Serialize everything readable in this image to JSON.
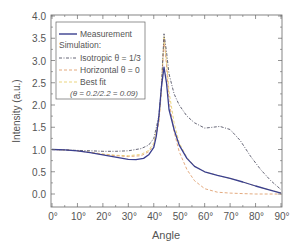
{
  "chart_data": {
    "type": "line",
    "title": "",
    "xlabel": "Angle",
    "ylabel": "Intensity (a.u.)",
    "xlim": [
      0,
      90
    ],
    "ylim": [
      -0.3,
      4.0
    ],
    "x_ticks": [
      "0°",
      "10°",
      "20°",
      "30°",
      "40°",
      "50°",
      "60°",
      "70°",
      "80°",
      "90°"
    ],
    "x_tick_values": [
      0,
      10,
      20,
      30,
      40,
      50,
      60,
      70,
      80,
      90
    ],
    "y_ticks": [
      "0.0",
      "0.5",
      "1.0",
      "1.5",
      "2.0",
      "2.5",
      "3.0",
      "3.5",
      "4.0"
    ],
    "y_tick_values": [
      0,
      0.5,
      1,
      1.5,
      2,
      2.5,
      3,
      3.5,
      4
    ],
    "grid": false,
    "legend_position": "upper left",
    "legend": {
      "entries": [
        {
          "label": "Measurement",
          "style": "solid",
          "color": "#3a3f8f"
        },
        {
          "label": "Simulation:",
          "style": "none",
          "color": ""
        },
        {
          "label": "Isotropic θ = 1/3",
          "style": "dashdot",
          "color": "#555566"
        },
        {
          "label": "Horizontal θ = 0",
          "style": "dashed",
          "color": "#e0a070"
        },
        {
          "label": "Best fit",
          "style": "dashed",
          "color": "#e8d070"
        },
        {
          "label": "(θ = 0.2/2.2 = 0.09)",
          "style": "none",
          "color": ""
        }
      ]
    },
    "series": [
      {
        "name": "Measurement",
        "color": "#3a3f8f",
        "style": "solid",
        "x": [
          0,
          5,
          10,
          15,
          20,
          25,
          30,
          33,
          36,
          38,
          40,
          41,
          42,
          43,
          44,
          45,
          46,
          48,
          50,
          53,
          56,
          60,
          65,
          70,
          75,
          80,
          85,
          90
        ],
        "y": [
          1.0,
          0.99,
          0.97,
          0.93,
          0.88,
          0.83,
          0.78,
          0.77,
          0.8,
          0.88,
          1.05,
          1.3,
          1.75,
          2.4,
          2.85,
          2.5,
          1.9,
          1.45,
          1.1,
          0.8,
          0.62,
          0.5,
          0.42,
          0.35,
          0.27,
          0.18,
          0.1,
          0.02
        ]
      },
      {
        "name": "Isotropic θ = 1/3",
        "color": "#555566",
        "style": "dashdot",
        "x": [
          0,
          5,
          10,
          15,
          20,
          25,
          30,
          35,
          38,
          40,
          42,
          43,
          44,
          45,
          46,
          48,
          50,
          53,
          56,
          60,
          63,
          66,
          70,
          74,
          78,
          82,
          86,
          90
        ],
        "y": [
          1.0,
          0.99,
          0.98,
          0.97,
          0.96,
          0.96,
          0.97,
          1.02,
          1.1,
          1.25,
          1.75,
          2.4,
          3.6,
          3.2,
          2.7,
          2.25,
          2.0,
          1.75,
          1.6,
          1.48,
          1.5,
          1.52,
          1.45,
          1.2,
          0.85,
          0.55,
          0.3,
          0.1
        ]
      },
      {
        "name": "Horizontal θ = 0",
        "color": "#e0a070",
        "style": "dashed",
        "x": [
          0,
          5,
          10,
          15,
          20,
          25,
          30,
          35,
          38,
          40,
          42,
          43,
          44,
          45,
          46,
          48,
          50,
          53,
          56,
          60,
          65,
          70,
          75,
          80,
          85,
          90
        ],
        "y": [
          1.0,
          0.99,
          0.97,
          0.93,
          0.89,
          0.86,
          0.84,
          0.86,
          0.95,
          1.1,
          1.6,
          2.3,
          3.5,
          2.9,
          2.1,
          1.4,
          0.95,
          0.55,
          0.3,
          0.12,
          0.04,
          0.02,
          0.01,
          0.0,
          0.0,
          0.0
        ]
      },
      {
        "name": "Best fit",
        "color": "#e8d070",
        "style": "dashed",
        "x": [
          0,
          5,
          10,
          15,
          20,
          25,
          30,
          35,
          38,
          40,
          42,
          43,
          44,
          45,
          46,
          48,
          50,
          53,
          56,
          60,
          65,
          70,
          75,
          80,
          85,
          90
        ],
        "y": [
          1.0,
          0.99,
          0.97,
          0.94,
          0.9,
          0.87,
          0.86,
          0.89,
          0.98,
          1.15,
          1.65,
          2.35,
          3.55,
          3.0,
          2.3,
          1.6,
          1.15,
          0.82,
          0.63,
          0.5,
          0.42,
          0.35,
          0.27,
          0.18,
          0.1,
          0.03
        ]
      }
    ]
  }
}
